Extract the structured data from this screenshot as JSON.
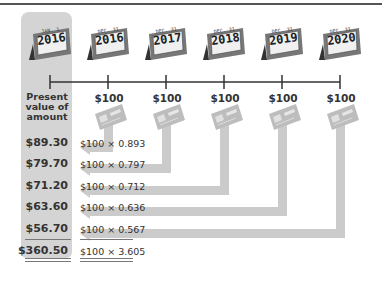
{
  "diagram": {
    "start_calendar": {
      "month_day": "JAN. 1",
      "year": "2016"
    },
    "calendars": [
      {
        "month_day": "DEC. 31",
        "year": "2016"
      },
      {
        "month_day": "DEC. 31",
        "year": "2017"
      },
      {
        "month_day": "DEC. 31",
        "year": "2018"
      },
      {
        "month_day": "DEC. 31",
        "year": "2019"
      },
      {
        "month_day": "DEC. 31",
        "year": "2020"
      }
    ],
    "payment_label": "$100",
    "payments": [
      "$100",
      "$100",
      "$100",
      "$100",
      "$100"
    ],
    "column_header": "Present value of amount",
    "column_header_lines": [
      "Present",
      "value of",
      "amount"
    ],
    "rows": [
      {
        "present_value": "$89.30",
        "formula": "$100 × 0.893"
      },
      {
        "present_value": "$79.70",
        "formula": "$100 × 0.797"
      },
      {
        "present_value": "$71.20",
        "formula": "$100 × 0.712"
      },
      {
        "present_value": "$63.60",
        "formula": "$100 × 0.636"
      },
      {
        "present_value": "$56.70",
        "formula": "$100 × 0.567"
      }
    ],
    "total": {
      "present_value": "$360.50",
      "formula": "$100 × 3.605"
    },
    "colors": {
      "panel": "#d4d4d4",
      "arrow": "#c8c8c8",
      "line": "#333333",
      "check": "#bdbdbd"
    }
  }
}
